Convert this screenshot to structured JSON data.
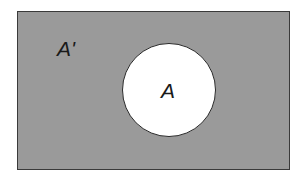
{
  "diagram": {
    "type": "venn",
    "universe": {
      "label": "A'",
      "fill_color": "#9a9a9a",
      "border_color": "#3a3a3a"
    },
    "set": {
      "label": "A",
      "fill_color": "#ffffff",
      "border_color": "#2a2a2a"
    }
  }
}
